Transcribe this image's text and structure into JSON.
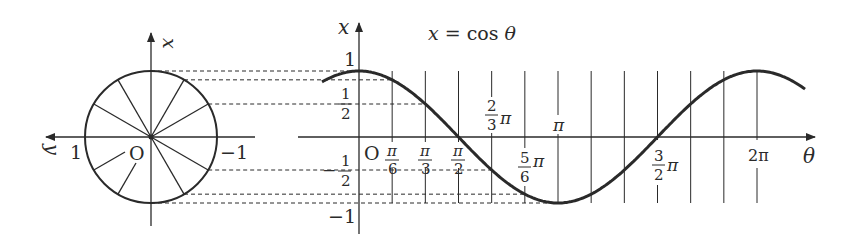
{
  "title": "x = cos θ",
  "title_parts": {
    "lhs": "x",
    "eq": " = cos ",
    "var": "θ"
  },
  "colors": {
    "ink": "#2a2a2a",
    "background": "#ffffff"
  },
  "unit_circle": {
    "center": [
      151,
      137
    ],
    "radius": 66,
    "spoke_count": 12,
    "spoke_step_deg": 30,
    "vertical_axis_label": "x",
    "horizontal_axis_label": "y",
    "horizontal_axis_direction": "left",
    "labels": {
      "positive_one": "1",
      "origin": "O",
      "negative_one": "−1"
    }
  },
  "graph": {
    "origin": [
      359,
      137
    ],
    "unit_px": 66,
    "pi_px": 199,
    "x_axis_label": "θ",
    "y_axis_label": "x",
    "y_tick_labels": {
      "one": "1",
      "half_num": "1",
      "half_den": "2",
      "neg_half_sign": "−",
      "neg_half_num": "1",
      "neg_half_den": "2",
      "neg_one": "−1"
    },
    "origin_label": "O",
    "theta_ticks": [
      {
        "value": "π/6",
        "num": "π",
        "den": "6"
      },
      {
        "value": "π/3",
        "num": "π",
        "den": "3"
      },
      {
        "value": "π/2",
        "num": "π",
        "den": "2"
      },
      {
        "value": "2/3 π",
        "num": "2",
        "den": "3",
        "suffix": "π"
      },
      {
        "value": "5/6 π",
        "num": "5",
        "den": "6",
        "suffix": "π"
      },
      {
        "value": "π",
        "text": "π"
      },
      {
        "value": "3/2 π",
        "num": "3",
        "den": "2",
        "suffix": "π"
      },
      {
        "value": "2π",
        "text": "2π"
      }
    ]
  },
  "chart_data": {
    "type": "line",
    "title": "x = cos θ",
    "xlabel": "θ",
    "ylabel": "x",
    "x_ticks": [
      "π/6",
      "π/3",
      "π/2",
      "2π/3",
      "5π/6",
      "π",
      "3π/2",
      "2π"
    ],
    "y_ticks": [
      "-1",
      "-1/2",
      "1/2",
      "1"
    ],
    "xlim": [
      "-π/3",
      "2π+π/4"
    ],
    "ylim": [
      -1,
      1
    ],
    "grid": "vertical lines every π/6 from 0 to 2π",
    "series": [
      {
        "name": "x = cos θ",
        "x": [
          "0",
          "π/6",
          "π/3",
          "π/2",
          "2π/3",
          "5π/6",
          "π",
          "7π/6",
          "4π/3",
          "3π/2",
          "5π/3",
          "11π/6",
          "2π"
        ],
        "values": [
          1,
          0.866,
          0.5,
          0,
          -0.5,
          -0.866,
          -1,
          -0.866,
          -0.5,
          0,
          0.5,
          0.866,
          1
        ]
      }
    ],
    "projection_lines": "dashed horizontal lines from the unit circle to the graph at x = 1, √3/2, 1/2, −1/2, −√3/2, −1"
  }
}
